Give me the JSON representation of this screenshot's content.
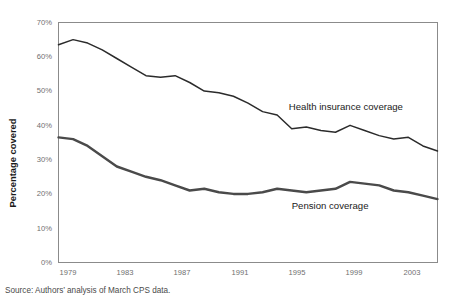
{
  "chart_data": {
    "type": "line",
    "title": "",
    "xlabel": "",
    "ylabel": "Percentage covered",
    "ylim": [
      0,
      70
    ],
    "xlim": [
      1979,
      2005
    ],
    "grid": false,
    "legend_position": "inline-annotation",
    "ytick_labels": [
      "0%",
      "10%",
      "20%",
      "30%",
      "40%",
      "50%",
      "60%",
      "70%"
    ],
    "ytick_values": [
      0,
      10,
      20,
      30,
      40,
      50,
      60,
      70
    ],
    "xtick_labels": [
      "1979",
      "1983",
      "1987",
      "1991",
      "1995",
      "1999",
      "2003"
    ],
    "xtick_values": [
      1979,
      1983,
      1987,
      1991,
      1995,
      1999,
      2003
    ],
    "x": [
      1979,
      1980,
      1981,
      1982,
      1983,
      1984,
      1985,
      1986,
      1987,
      1988,
      1989,
      1990,
      1991,
      1992,
      1993,
      1994,
      1995,
      1996,
      1997,
      1998,
      1999,
      2000,
      2001,
      2002,
      2003,
      2004,
      2005
    ],
    "series": [
      {
        "name": "Health insurance coverage",
        "label": "Health insurance coverage",
        "color": "#2b2b2b",
        "values": [
          63.5,
          65.0,
          64.0,
          62.0,
          59.5,
          57.0,
          54.5,
          54.0,
          54.5,
          52.5,
          50.0,
          49.5,
          48.5,
          46.5,
          44.0,
          43.0,
          39.0,
          39.5,
          38.5,
          38.0,
          40.0,
          38.5,
          37.0,
          36.0,
          36.5,
          34.0,
          32.5
        ]
      },
      {
        "name": "Pension coverage",
        "label": "Pension coverage",
        "color": "#4a4a4a",
        "values": [
          36.5,
          36.0,
          34.0,
          31.0,
          28.0,
          26.5,
          25.0,
          24.0,
          22.5,
          21.0,
          21.5,
          20.5,
          20.0,
          20.0,
          20.5,
          21.5,
          21.0,
          20.5,
          21.0,
          21.5,
          23.5,
          23.0,
          22.5,
          21.0,
          20.5,
          19.5,
          18.5
        ]
      }
    ],
    "annotations": [
      {
        "text": "Health insurance coverage",
        "x": 1994.8,
        "y": 44.5
      },
      {
        "text": "Pension coverage",
        "x": 1995.0,
        "y": 15.5
      }
    ]
  },
  "footer": {
    "source_note": "Source: Authors’ analysis of March CPS data."
  }
}
